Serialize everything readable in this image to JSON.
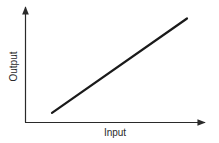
{
  "chart_data": {
    "type": "line",
    "title": "",
    "xlabel": "Input",
    "ylabel": "Output",
    "grid": false,
    "legend": null,
    "ticks": {
      "x": [],
      "y": []
    },
    "series": [
      {
        "name": "Output vs Input",
        "x": [
          0.15,
          0.9
        ],
        "y": [
          0.08,
          0.9
        ]
      }
    ],
    "xlim": [
      0,
      1
    ],
    "ylim": [
      0,
      1
    ],
    "colors": {
      "line": "#1a1a1a",
      "axis": "#2a2a2a",
      "background": "#ffffff"
    }
  },
  "labels": {
    "x_axis": "Input",
    "y_axis": "Output"
  }
}
